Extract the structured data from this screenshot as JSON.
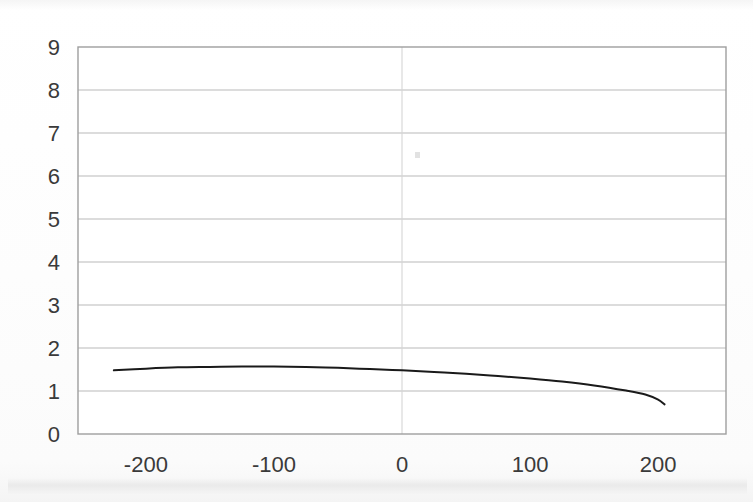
{
  "chart_data": {
    "type": "line",
    "title": "",
    "subtitle": "",
    "xlabel": "",
    "ylabel": "",
    "xlim": [
      -253,
      253
    ],
    "ylim": [
      0,
      9
    ],
    "grid": true,
    "grid_axis": "both",
    "legend": false,
    "legend_position": "none",
    "x_ticks": [
      -200,
      -100,
      0,
      100,
      200
    ],
    "x_tick_labels": [
      "-200",
      "-100",
      "0",
      "100",
      "200"
    ],
    "y_ticks": [
      0,
      1,
      2,
      3,
      4,
      5,
      6,
      7,
      8,
      9
    ],
    "y_tick_labels": [
      "0",
      "1",
      "2",
      "3",
      "4",
      "5",
      "6",
      "7",
      "8",
      "9"
    ],
    "series": [
      {
        "name": "curve-1",
        "color": "#1a1a1a",
        "line_width": 2,
        "marker": "none",
        "x": [
          -225,
          -200,
          -175,
          -150,
          -125,
          -100,
          -75,
          -50,
          -25,
          0,
          25,
          50,
          75,
          100,
          125,
          150,
          175,
          190,
          200,
          205
        ],
        "y": [
          1.48,
          1.52,
          1.55,
          1.56,
          1.57,
          1.57,
          1.56,
          1.54,
          1.51,
          1.48,
          1.44,
          1.4,
          1.35,
          1.29,
          1.22,
          1.13,
          1.01,
          0.92,
          0.8,
          0.69
        ]
      }
    ],
    "annotations": [],
    "colors": {
      "line": "#1a1a1a",
      "grid": "#b9b9b9",
      "axis_border": "#9a9a9a",
      "tick_text": "#3a3a3a",
      "background": "#ffffff"
    }
  },
  "figure": {
    "plot_left_px": 78,
    "plot_right_px": 726,
    "plot_top_px": 47,
    "plot_bottom_px": 434,
    "artifact_label": "scan-speck"
  }
}
